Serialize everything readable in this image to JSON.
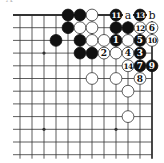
{
  "diagram": {
    "type": "go-board-fragment",
    "corner_label": "A",
    "corner": "top-right",
    "columns": 12,
    "rows": 12,
    "origin_x": 20,
    "origin_y": 15,
    "spacing_x": 12,
    "spacing_y": 12.7,
    "colors": {
      "line": "#333333",
      "black_stone": "#111111",
      "white_stone": "#ffffff",
      "white_stone_border": "#333333",
      "black_label": "#ffffff",
      "white_label": "#111111",
      "mark_label": "#111111"
    },
    "star_points": [
      {
        "col": 2,
        "row": 3
      },
      {
        "col": 8,
        "row": 3
      },
      {
        "col": 2,
        "row": 9
      },
      {
        "col": 8,
        "row": 9
      }
    ],
    "stones": [
      {
        "col": 4,
        "row": 0,
        "color": "black",
        "label": ""
      },
      {
        "col": 5,
        "row": 0,
        "color": "black",
        "label": ""
      },
      {
        "col": 6,
        "row": 0,
        "color": "white",
        "label": ""
      },
      {
        "col": 8,
        "row": 0,
        "color": "black",
        "label": "11"
      },
      {
        "col": 10,
        "row": 0,
        "color": "black",
        "label": "13"
      },
      {
        "col": 4,
        "row": 1,
        "color": "black",
        "label": ""
      },
      {
        "col": 5,
        "row": 1,
        "color": "white",
        "label": ""
      },
      {
        "col": 6,
        "row": 1,
        "color": "white",
        "label": ""
      },
      {
        "col": 8,
        "row": 1,
        "color": "black",
        "label": ""
      },
      {
        "col": 9,
        "row": 1,
        "color": "black",
        "label": ""
      },
      {
        "col": 10,
        "row": 1,
        "color": "white",
        "label": "12"
      },
      {
        "col": 11,
        "row": 1,
        "color": "white",
        "label": "6"
      },
      {
        "col": 3,
        "row": 2,
        "color": "black",
        "label": ""
      },
      {
        "col": 5,
        "row": 2,
        "color": "black",
        "label": ""
      },
      {
        "col": 6,
        "row": 2,
        "color": "white",
        "label": ""
      },
      {
        "col": 7,
        "row": 2,
        "color": "white",
        "label": ""
      },
      {
        "col": 8,
        "row": 2,
        "color": "black",
        "label": "1"
      },
      {
        "col": 9,
        "row": 2,
        "color": "white",
        "label": ""
      },
      {
        "col": 10,
        "row": 2,
        "color": "black",
        "label": "5"
      },
      {
        "col": 11,
        "row": 2,
        "color": "white",
        "label": "10"
      },
      {
        "col": 5,
        "row": 3,
        "color": "black",
        "label": ""
      },
      {
        "col": 6,
        "row": 3,
        "color": "black",
        "label": ""
      },
      {
        "col": 7,
        "row": 3,
        "color": "white",
        "label": "2"
      },
      {
        "col": 8,
        "row": 3,
        "color": "white",
        "label": ""
      },
      {
        "col": 9,
        "row": 3,
        "color": "white",
        "label": "4"
      },
      {
        "col": 10,
        "row": 3,
        "color": "black",
        "label": "3"
      },
      {
        "col": 9,
        "row": 4,
        "color": "white",
        "label": "14"
      },
      {
        "col": 10,
        "row": 4,
        "color": "black",
        "label": "7"
      },
      {
        "col": 11,
        "row": 4,
        "color": "black",
        "label": "9"
      },
      {
        "col": 6,
        "row": 5,
        "color": "white",
        "label": ""
      },
      {
        "col": 8,
        "row": 5,
        "color": "white",
        "label": ""
      },
      {
        "col": 10,
        "row": 5,
        "color": "white",
        "label": "8"
      },
      {
        "col": 9,
        "row": 6,
        "color": "white",
        "label": ""
      },
      {
        "col": 9,
        "row": 8,
        "color": "white",
        "label": ""
      }
    ],
    "marks": [
      {
        "col": 9,
        "row": 0,
        "label": "a"
      },
      {
        "col": 11,
        "row": 0,
        "label": "b"
      }
    ]
  }
}
